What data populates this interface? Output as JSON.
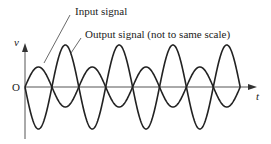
{
  "diagram": {
    "labels": {
      "input": "Input signal",
      "output": "Output signal (not to same scale)",
      "y_axis": "v",
      "x_axis": "t",
      "origin": "O"
    },
    "colors": {
      "stroke": "#222222",
      "axis": "#555555"
    },
    "geometry": {
      "origin_x": 25,
      "baseline_y": 87,
      "half_period": 26.9,
      "cycles": 4,
      "input_amplitude": 20,
      "output_amplitude": 42
    }
  }
}
